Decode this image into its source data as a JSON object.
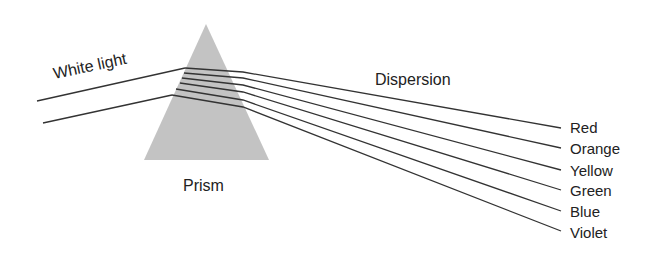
{
  "diagram": {
    "type": "prism-dispersion",
    "labels": {
      "incoming": "White light",
      "prism": "Prism",
      "outgoing": "Dispersion"
    },
    "spectrum": [
      {
        "name": "Red",
        "end_y": 128
      },
      {
        "name": "Orange",
        "end_y": 148
      },
      {
        "name": "Yellow",
        "end_y": 170
      },
      {
        "name": "Green",
        "end_y": 190
      },
      {
        "name": "Blue",
        "end_y": 211
      },
      {
        "name": "Violet",
        "end_y": 231
      }
    ],
    "colors": {
      "prism_fill": "#b8b8b8",
      "line": "#333333",
      "text": "#222222",
      "background": "#ffffff"
    }
  }
}
